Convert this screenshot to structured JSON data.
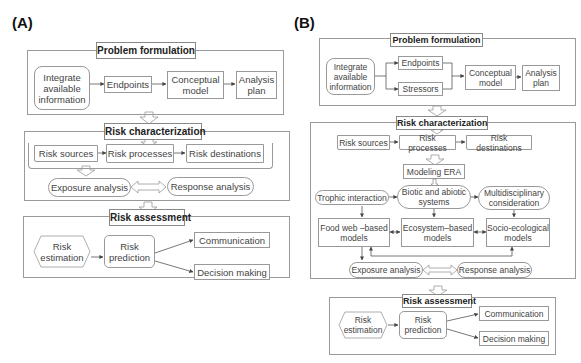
{
  "panel_a": {
    "label": "(A)",
    "problem_formulation": {
      "title": "Problem formulation",
      "integrate": "Integrate available information",
      "endpoints": "Endpoints",
      "conceptual_model": "Conceptual model",
      "analysis_plan": "Analysis plan"
    },
    "risk_characterization": {
      "title": "Risk characterization",
      "risk_sources": "Risk sources",
      "risk_processes": "Risk processes",
      "risk_destinations": "Risk destinations",
      "exposure_analysis": "Exposure analysis",
      "response_analysis": "Response analysis"
    },
    "risk_assessment": {
      "title": "Risk assessment",
      "risk_estimation": "Risk estimation",
      "risk_prediction": "Risk prediction",
      "communication": "Communication",
      "decision_making": "Decision making"
    }
  },
  "panel_b": {
    "label": "(B)",
    "problem_formulation": {
      "title": "Problem formulation",
      "integrate": "Integrate available information",
      "endpoints": "Endpoints",
      "stressors": "Stressors",
      "conceptual_model": "Conceptual model",
      "analysis_plan": "Analysis plan"
    },
    "risk_characterization": {
      "title": "Risk characterization",
      "risk_sources": "Risk sources",
      "risk_processes": "Risk processes",
      "risk_destinations": "Risk destinations",
      "modeling_era": "Modeling ERA",
      "trophic_interaction": "Trophic interaction",
      "biotic_abiotic": "Biotic and abiotic systems",
      "multidisciplinary": "Multidisciplinary consideration",
      "food_web_models": "Food web –based models",
      "ecosystem_models": "Ecosystem–based models",
      "socio_ecological_models": "Socio-ecological models",
      "exposure_analysis": "Exposure analysis",
      "response_analysis": "Response analysis"
    },
    "risk_assessment": {
      "title": "Risk assessment",
      "risk_estimation": "Risk estimation",
      "risk_prediction": "Risk prediction",
      "communication": "Communication",
      "decision_making": "Decision making"
    }
  }
}
